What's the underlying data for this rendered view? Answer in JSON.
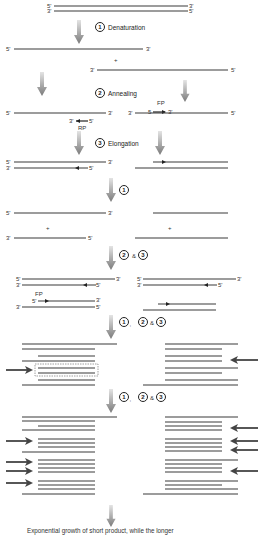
{
  "diagram": {
    "colors": {
      "strand": "#3a3a3a",
      "arrow_gradient_top": "#d0d0d0",
      "arrow_gradient_bottom": "#7a7a7a",
      "pointer_arrow": "#444444",
      "dashed_box": "#888888"
    },
    "end_labels": {
      "five_prime": "5'",
      "three_prime": "3'",
      "five_prime_short": "5"
    },
    "plus": "+",
    "ampersand": "&",
    "comma": ",",
    "steps": [
      {
        "number": "1",
        "label": "Denaturation"
      },
      {
        "number": "2",
        "label": "Annealing"
      },
      {
        "number": "3",
        "label": "Elongation"
      }
    ],
    "primers": {
      "forward": "FP",
      "reverse": "RP"
    },
    "cycle_labels": {
      "cycle2_denature": "1",
      "cycle2_anneal": "2",
      "cycle2_elong": "3",
      "cycle3_a": "1",
      "cycle3_b": "2",
      "cycle3_c": "3",
      "cycle4_a": "1",
      "cycle4_b": "2",
      "cycle4_c": "3"
    },
    "caption": "Exponential growth of short product, while the longer"
  }
}
